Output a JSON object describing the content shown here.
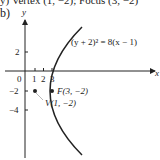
{
  "clipped_text": "y) Vertex (1, −2); Focus (3, −2)",
  "part_label": "b)",
  "graph": {
    "x_axis_label": "x",
    "y_axis_label": "y",
    "x_ticks": [
      "1",
      "2",
      "3"
    ],
    "y_ticks": [
      "2",
      "−2",
      "−4"
    ],
    "origin_label": "0",
    "equation": "(y + 2)² = 8(x − 1)",
    "focus_label": "F(3, −2)",
    "vertex_label": "V(1, −2)"
  }
}
